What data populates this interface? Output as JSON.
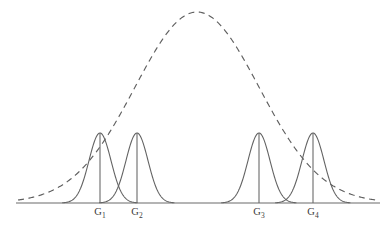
{
  "figure": {
    "title": "",
    "width": 391,
    "height": 229,
    "background": "#ffffff",
    "curve_color": "#636363",
    "axis_color": "#6b6b6b",
    "envelope_color": "#5f5f5f",
    "label_color": "#3b3b3b"
  },
  "chart_data": {
    "type": "line",
    "title": "",
    "subtitle": "",
    "xlabel": "",
    "ylabel": "",
    "grid": false,
    "legend": "none",
    "axis": {
      "baseline_y_px": 203,
      "x_start_px": 16,
      "x_end_px": 380,
      "xlim": [
        0,
        391
      ],
      "ylim": [
        0,
        229
      ]
    },
    "annotations": [
      "G1",
      "G2",
      "G3",
      "G4"
    ],
    "series": [
      {
        "name": "G1",
        "kind": "gaussian",
        "label": "G₁",
        "label_text": "G",
        "label_sub": "1",
        "center_px": 100,
        "sigma_px": 11,
        "peak_y_px": 133,
        "amplitude_px": 70,
        "has_stem": true,
        "style": "solid"
      },
      {
        "name": "G2",
        "kind": "gaussian",
        "label": "G₂",
        "label_text": "G",
        "label_sub": "2",
        "center_px": 137,
        "sigma_px": 11,
        "peak_y_px": 133,
        "amplitude_px": 70,
        "has_stem": true,
        "style": "solid"
      },
      {
        "name": "G3",
        "kind": "gaussian",
        "label": "G₃",
        "label_text": "G",
        "label_sub": "3",
        "center_px": 259,
        "sigma_px": 11,
        "peak_y_px": 133,
        "amplitude_px": 70,
        "has_stem": true,
        "style": "solid"
      },
      {
        "name": "G4",
        "kind": "gaussian",
        "label": "G₄",
        "label_text": "G",
        "label_sub": "4",
        "center_px": 313,
        "sigma_px": 11,
        "peak_y_px": 133,
        "amplitude_px": 70,
        "has_stem": true,
        "style": "solid"
      },
      {
        "name": "envelope",
        "kind": "gaussian",
        "label": "",
        "center_px": 197,
        "sigma_px": 62,
        "peak_y_px": 12,
        "amplitude_px": 191,
        "has_stem": false,
        "style": "dashed"
      }
    ]
  },
  "labels": [
    {
      "text": "G",
      "sub": "1",
      "x_px": 100,
      "y_px": 207
    },
    {
      "text": "G",
      "sub": "2",
      "x_px": 137,
      "y_px": 207
    },
    {
      "text": "G",
      "sub": "3",
      "x_px": 259,
      "y_px": 207
    },
    {
      "text": "G",
      "sub": "4",
      "x_px": 313,
      "y_px": 207
    }
  ]
}
